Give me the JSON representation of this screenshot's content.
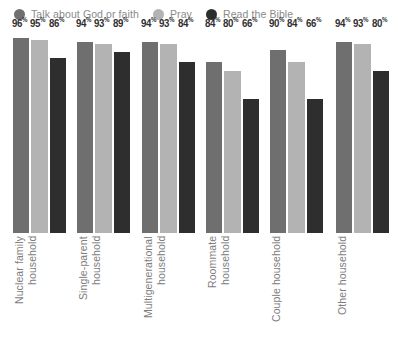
{
  "legend": {
    "items": [
      {
        "label": "Talk about God or faith",
        "color": "#6f6f6f",
        "icon": "circle-swatch-icon"
      },
      {
        "label": "Pray",
        "color": "#b3b3b3",
        "icon": "circle-swatch-icon"
      },
      {
        "label": "Read the Bible",
        "color": "#2e2e2e",
        "icon": "circle-swatch-icon"
      }
    ]
  },
  "chart_data": {
    "type": "bar",
    "title": "",
    "xlabel": "",
    "ylabel": "",
    "ylim": [
      0,
      100
    ],
    "grid": false,
    "legend_position": "top-left",
    "value_suffix": "%",
    "categories": [
      "Nuclear family\nhousehold",
      "Single-parent\nhousehold",
      "Multigenerational\nhousehold",
      "Roommate\nhousehold",
      "Couple household",
      "Other household"
    ],
    "series": [
      {
        "name": "Talk about God or faith",
        "color": "#6f6f6f",
        "values": [
          96,
          94,
          94,
          84,
          90,
          94
        ]
      },
      {
        "name": "Pray",
        "color": "#b3b3b3",
        "values": [
          95,
          93,
          93,
          80,
          84,
          93
        ]
      },
      {
        "name": "Read the Bible",
        "color": "#2e2e2e",
        "values": [
          86,
          89,
          84,
          66,
          66,
          80
        ]
      }
    ],
    "value_labels": [
      [
        "96",
        "95",
        "86"
      ],
      [
        "94",
        "93",
        "89"
      ],
      [
        "94",
        "93",
        "84"
      ],
      [
        "84",
        "80",
        "66"
      ],
      [
        "90",
        "84",
        "66"
      ],
      [
        "94",
        "93",
        "80"
      ]
    ]
  },
  "colors": {
    "background": "#ffffff",
    "label_text": "#7d7d7d",
    "value_text": "#2f2f2f"
  }
}
